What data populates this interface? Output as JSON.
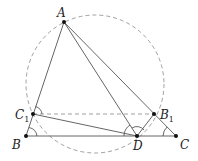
{
  "diagram": {
    "points": [
      {
        "id": "A",
        "label": "A",
        "sub": ""
      },
      {
        "id": "B",
        "label": "B",
        "sub": ""
      },
      {
        "id": "C",
        "label": "C",
        "sub": ""
      },
      {
        "id": "D",
        "label": "D",
        "sub": ""
      },
      {
        "id": "C1",
        "label": "C",
        "sub": "1"
      },
      {
        "id": "B1",
        "label": "B",
        "sub": "1"
      }
    ],
    "segments": [
      [
        "A",
        "B"
      ],
      [
        "A",
        "C"
      ],
      [
        "A",
        "D"
      ],
      [
        "B",
        "C"
      ],
      [
        "C1",
        "D"
      ],
      [
        "D",
        "B1"
      ]
    ],
    "dashed_segments": [
      [
        "C1",
        "B1"
      ]
    ],
    "circle": "circumcircle of A, C1, D, B1 (dashed)",
    "angle_marks": [
      "at C1 (angle A C1 B1)",
      "at B (angle C1 B D)",
      "at D (angle A D B)",
      "at D (angle B1 D A)",
      "at C (angle B1 C D)"
    ]
  }
}
